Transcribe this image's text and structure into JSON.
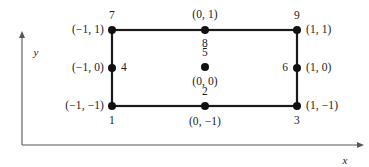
{
  "figure": {
    "type": "nine-node-quadrilateral-element-diagram",
    "axes": {
      "x_label": "x",
      "y_label": "y",
      "x_axis": {
        "x1": 22,
        "y1": 145,
        "x2": 358,
        "y2": 145,
        "arrow": "right"
      },
      "y_axis": {
        "x1": 22,
        "y1": 145,
        "x2": 22,
        "y2": 37,
        "arrow": "up"
      },
      "x_label_pos": {
        "x": 345,
        "y": 160
      },
      "y_label_pos": {
        "x": 36,
        "y": 52
      }
    },
    "element": {
      "left": 112,
      "right": 297,
      "top": 30,
      "bottom": 106,
      "stroke": "#1a1a1a",
      "stroke_width": 2.2,
      "node_radius": 4.0,
      "node_fill": "#111111"
    },
    "nodes": [
      {
        "id": "1",
        "number": "1",
        "coord": "(−1, −1)",
        "cx": 112,
        "cy": 106,
        "num_pos": {
          "x": 112,
          "y": 121,
          "anchor": "center"
        },
        "coord_pos": {
          "x": 104,
          "y": 106,
          "anchor": "right"
        }
      },
      {
        "id": "2",
        "number": "2",
        "coord": "(0, −1)",
        "cx": 205,
        "cy": 106,
        "num_pos": {
          "x": 205,
          "y": 92,
          "anchor": "center"
        },
        "coord_pos": {
          "x": 205,
          "y": 122,
          "anchor": "center"
        }
      },
      {
        "id": "3",
        "number": "3",
        "coord": "(1, −1)",
        "cx": 297,
        "cy": 106,
        "num_pos": {
          "x": 297,
          "y": 121,
          "anchor": "center"
        },
        "coord_pos": {
          "x": 306,
          "y": 106,
          "anchor": "left"
        }
      },
      {
        "id": "4",
        "number": "4",
        "coord": "(−1, 0)",
        "cx": 112,
        "cy": 68,
        "num_pos": {
          "x": 121,
          "y": 68,
          "anchor": "left"
        },
        "coord_pos": {
          "x": 104,
          "y": 68,
          "anchor": "right"
        }
      },
      {
        "id": "5",
        "number": "5",
        "coord": "(0, 0)",
        "cx": 205,
        "cy": 67,
        "num_pos": {
          "x": 205,
          "y": 53,
          "anchor": "center"
        },
        "coord_pos": {
          "x": 205,
          "y": 82,
          "anchor": "center"
        }
      },
      {
        "id": "6",
        "number": "6",
        "coord": "(1, 0)",
        "cx": 297,
        "cy": 68,
        "num_pos": {
          "x": 288,
          "y": 68,
          "anchor": "right"
        },
        "coord_pos": {
          "x": 306,
          "y": 68,
          "anchor": "left"
        }
      },
      {
        "id": "7",
        "number": "7",
        "coord": "(−1, 1)",
        "cx": 112,
        "cy": 30,
        "num_pos": {
          "x": 112,
          "y": 16,
          "anchor": "center"
        },
        "coord_pos": {
          "x": 104,
          "y": 30,
          "anchor": "right"
        }
      },
      {
        "id": "8",
        "number": "8",
        "coord": "(0, 1)",
        "cx": 205,
        "cy": 30,
        "num_pos": {
          "x": 205,
          "y": 44,
          "anchor": "center"
        },
        "coord_pos": {
          "x": 205,
          "y": 15,
          "anchor": "center"
        }
      },
      {
        "id": "9",
        "number": "9",
        "coord": "(1, 1)",
        "cx": 297,
        "cy": 30,
        "num_pos": {
          "x": 297,
          "y": 16,
          "anchor": "center"
        },
        "coord_pos": {
          "x": 306,
          "y": 30,
          "anchor": "left"
        }
      }
    ]
  }
}
